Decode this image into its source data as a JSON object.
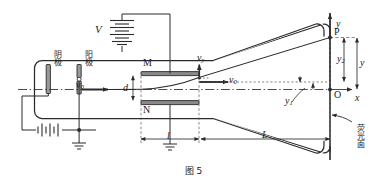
{
  "figure": {
    "caption": "图 5",
    "domain_type": "physics-diagram"
  },
  "colors": {
    "stroke": "#2b2b2b",
    "plate_fill": "#8a8a8a",
    "electrode_fill": "#9a9a9a",
    "dash": "#555555",
    "background": "#ffffff",
    "text": "#1a1a1a"
  },
  "labels": {
    "supply_voltage": "V",
    "cathode": "阴极",
    "anode": "阳极",
    "plate_top": "M",
    "plate_bottom": "N",
    "screen": "荧光面",
    "origin": "O",
    "point_p": "P",
    "axis_x": "x",
    "axis_y": "y",
    "v0_left": "v",
    "v0_left_sub": "0",
    "v0_right": "v",
    "v0_right_sub": "0",
    "vy": "v",
    "vy_sub": "y",
    "gap_d": "d",
    "plate_length": "l",
    "drift_length": "L",
    "defl_y1": "y",
    "defl_y1_sub": "1",
    "defl_y2": "y",
    "defl_y2_sub": "2",
    "total_y": "y"
  },
  "quantities": [
    {
      "symbol": "V",
      "meaning": "deflecting-plate potential difference"
    },
    {
      "symbol": "v0",
      "meaning": "initial horizontal speed of electron beam"
    },
    {
      "symbol": "vy",
      "meaning": "transverse velocity gained between plates"
    },
    {
      "symbol": "d",
      "meaning": "separation between plates M and N"
    },
    {
      "symbol": "l",
      "meaning": "length of the deflecting plates"
    },
    {
      "symbol": "L",
      "meaning": "distance from plate exit to fluorescent screen"
    },
    {
      "symbol": "y1",
      "meaning": "deflection inside the plates"
    },
    {
      "symbol": "y2",
      "meaning": "deflection over the drift region"
    },
    {
      "symbol": "y",
      "meaning": "total deflection on the screen at point P"
    }
  ],
  "components": [
    {
      "name": "electron-gun-cathode",
      "label": "阴极"
    },
    {
      "name": "electron-gun-anode",
      "label": "阳极"
    },
    {
      "name": "deflecting-plate-m",
      "label": "M"
    },
    {
      "name": "deflecting-plate-n",
      "label": "N"
    },
    {
      "name": "fluorescent-screen",
      "label": "荧光面"
    },
    {
      "name": "plate-battery",
      "label": "V"
    },
    {
      "name": "accelerating-battery",
      "label": ""
    },
    {
      "name": "ground-symbol",
      "label": ""
    }
  ]
}
